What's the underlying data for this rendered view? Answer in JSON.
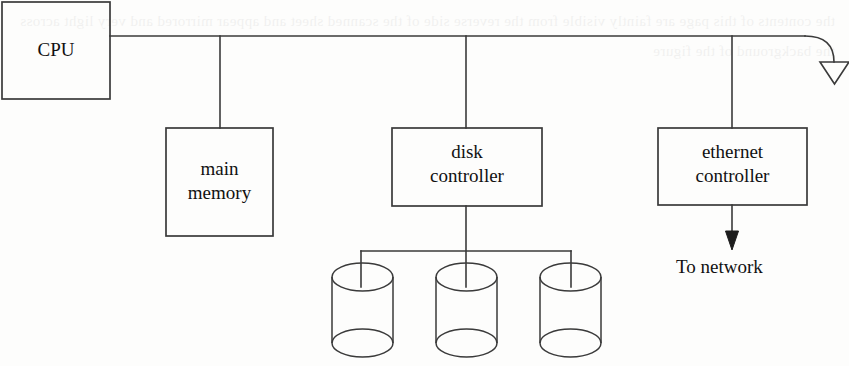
{
  "diagram": {
    "type": "block-diagram",
    "stroke_color": "#3a3a3a",
    "text_color": "#111111",
    "background_color": "#fdfdfc",
    "nodes": [
      {
        "id": "cpu",
        "label": "CPU",
        "shape": "rectangle",
        "x": 2,
        "y": 2,
        "w": 108,
        "h": 97
      },
      {
        "id": "main-memory",
        "label": "main\nmemory",
        "line1": "main",
        "line2": "memory",
        "shape": "rectangle",
        "x": 166,
        "y": 128,
        "w": 107,
        "h": 108
      },
      {
        "id": "disk-controller",
        "label": "disk\ncontroller",
        "line1": "disk",
        "line2": "controller",
        "shape": "rectangle",
        "x": 392,
        "y": 128,
        "w": 150,
        "h": 78
      },
      {
        "id": "ethernet-controller",
        "label": "ethernet\ncontroller",
        "line1": "ethernet",
        "line2": "controller",
        "shape": "rectangle",
        "x": 658,
        "y": 128,
        "w": 149,
        "h": 77
      },
      {
        "id": "disk-1",
        "label": "",
        "shape": "cylinder",
        "x": 332,
        "y": 263,
        "w": 61,
        "h": 94
      },
      {
        "id": "disk-2",
        "label": "",
        "shape": "cylinder",
        "x": 436,
        "y": 263,
        "w": 61,
        "h": 94
      },
      {
        "id": "disk-3",
        "label": "",
        "shape": "cylinder",
        "x": 540,
        "y": 263,
        "w": 61,
        "h": 94
      }
    ],
    "free_labels": [
      {
        "id": "to-network",
        "text": "To network",
        "x": 676,
        "y": 256
      }
    ],
    "edges": [
      {
        "id": "bus-main",
        "from": "cpu",
        "to": "bus-end",
        "kind": "bus-line"
      },
      {
        "id": "bus-to-main-memory",
        "from": "bus",
        "to": "main-memory",
        "kind": "drop"
      },
      {
        "id": "bus-to-disk-controller",
        "from": "bus",
        "to": "disk-controller",
        "kind": "drop"
      },
      {
        "id": "bus-to-ethernet-controller",
        "from": "bus",
        "to": "ethernet-controller",
        "kind": "drop"
      },
      {
        "id": "disk-controller-to-disks",
        "from": "disk-controller",
        "to": "disks",
        "kind": "fan-out"
      },
      {
        "id": "ethernet-to-network",
        "from": "ethernet-controller",
        "to": "to-network",
        "kind": "arrow-solid"
      },
      {
        "id": "bus-terminator",
        "from": "bus",
        "to": "off-page",
        "kind": "arrow-hollow"
      }
    ]
  },
  "bleed_text": "the contents of this page are faintly visible from the reverse side of the scanned sheet and appear mirrored and very light across the background of the figure"
}
